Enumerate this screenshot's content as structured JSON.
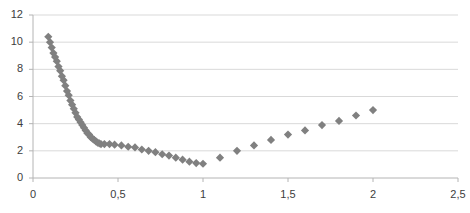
{
  "chart_data": {
    "type": "scatter",
    "title": "",
    "subtitle": "",
    "xlabel": "",
    "ylabel": "",
    "xlim": [
      0,
      2.5
    ],
    "ylim": [
      0,
      12
    ],
    "xticks": [
      0,
      0.5,
      1,
      1.5,
      2,
      2.5
    ],
    "xtick_labels": [
      "0",
      "0,5",
      "1",
      "1,5",
      "2",
      "2,5"
    ],
    "yticks": [
      0,
      2,
      4,
      6,
      8,
      10,
      12
    ],
    "ytick_labels": [
      "0",
      "2",
      "4",
      "6",
      "8",
      "10",
      "12"
    ],
    "grid": "horizontal",
    "legend": "none",
    "decimal_separator": ",",
    "marker": "diamond",
    "marker_color": "#808080",
    "marker_size": 5,
    "series": [
      {
        "name": "series-1",
        "x": [
          0.09,
          0.1,
          0.11,
          0.12,
          0.13,
          0.14,
          0.15,
          0.16,
          0.17,
          0.18,
          0.19,
          0.2,
          0.21,
          0.22,
          0.23,
          0.24,
          0.25,
          0.26,
          0.27,
          0.28,
          0.29,
          0.3,
          0.31,
          0.32,
          0.33,
          0.34,
          0.35,
          0.36,
          0.37,
          0.38,
          0.39,
          0.4,
          0.42,
          0.45,
          0.48,
          0.52,
          0.56,
          0.6,
          0.64,
          0.68,
          0.72,
          0.76,
          0.8,
          0.84,
          0.88,
          0.92,
          0.96,
          1.0,
          1.1,
          1.2,
          1.3,
          1.4,
          1.5,
          1.6,
          1.7,
          1.8,
          1.9,
          2.0
        ],
        "y": [
          10.4,
          10.0,
          9.6,
          9.2,
          8.9,
          8.6,
          8.2,
          7.9,
          7.5,
          7.2,
          6.8,
          6.4,
          6.1,
          5.7,
          5.4,
          5.1,
          4.8,
          4.5,
          4.3,
          4.1,
          3.9,
          3.7,
          3.5,
          3.3,
          3.2,
          3.0,
          2.9,
          2.8,
          2.7,
          2.6,
          2.55,
          2.5,
          2.5,
          2.5,
          2.45,
          2.4,
          2.3,
          2.25,
          2.1,
          2.0,
          1.9,
          1.75,
          1.65,
          1.5,
          1.35,
          1.2,
          1.1,
          1.05,
          1.5,
          2.0,
          2.4,
          2.8,
          3.2,
          3.5,
          3.9,
          4.2,
          4.6,
          5.0
        ]
      }
    ]
  },
  "axes": {
    "y_axis_name": "value-axis",
    "x_axis_name": "category-axis"
  }
}
